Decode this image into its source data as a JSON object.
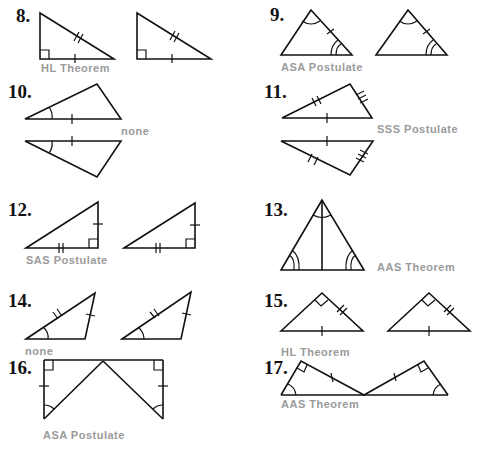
{
  "problems": [
    {
      "number": "8.",
      "answer": "HL Theorem"
    },
    {
      "number": "9.",
      "answer": "ASA Postulate"
    },
    {
      "number": "10.",
      "answer": "none"
    },
    {
      "number": "11.",
      "answer": "SSS Postulate"
    },
    {
      "number": "12.",
      "answer": "SAS Postulate"
    },
    {
      "number": "13.",
      "answer": "AAS Theorem"
    },
    {
      "number": "14.",
      "answer": "none"
    },
    {
      "number": "15.",
      "answer": "HL Theorem"
    },
    {
      "number": "16.",
      "answer": "ASA Postulate"
    },
    {
      "number": "17.",
      "answer": "AAS Theorem"
    }
  ],
  "colors": {
    "figure_stroke": "#111111",
    "answer_text": "#9a9a9a"
  }
}
